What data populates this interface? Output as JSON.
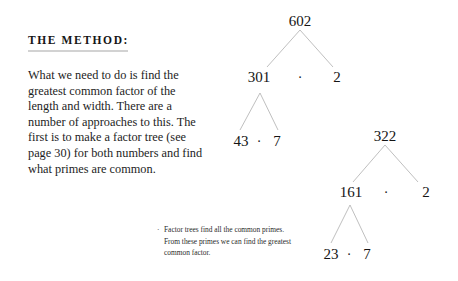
{
  "article": {
    "heading": "THE METHOD:",
    "body": "What we need to do is find the greatest common factor of the length and width. There are a number of approaches to this. The first is to make a factor tree (see page 30) for both numbers and find what primes are common."
  },
  "caption": {
    "bullet": "·",
    "text": "Factor trees find all the common primes. From these primes we can find the greatest common factor."
  },
  "trees": {
    "separator": "·",
    "first": {
      "root": "602",
      "level1": {
        "left": "301",
        "right": "2"
      },
      "level2": {
        "left": "43",
        "right": "7"
      }
    },
    "second": {
      "root": "322",
      "level1": {
        "left": "161",
        "right": "2"
      },
      "level2": {
        "left": "23",
        "right": "7"
      }
    }
  },
  "colors": {
    "ink": "#141414",
    "branch": "#b4b4b4",
    "rule": "#d2d2d2",
    "background": "#ffffff"
  }
}
